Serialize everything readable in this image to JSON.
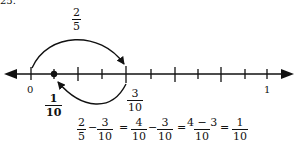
{
  "problem_number": "25.",
  "number_line": {
    "start_label": "0",
    "end_label": "1",
    "tick_count": 11,
    "marked_point": {
      "num": "1",
      "den": "10"
    },
    "jump_forward": {
      "num": "2",
      "den": "5"
    },
    "jump_back_landing": {
      "num": "3",
      "den": "10"
    }
  },
  "equation": {
    "t1": {
      "num": "2",
      "den": "5"
    },
    "op1": "−",
    "t2": {
      "num": "3",
      "den": "10"
    },
    "eq1": "=",
    "t3": {
      "num": "4",
      "den": "10"
    },
    "op2": "−",
    "t4": {
      "num": "3",
      "den": "10"
    },
    "eq2": "=",
    "t5": {
      "num": "4 − 3",
      "den": "10"
    },
    "eq3": "=",
    "t6": {
      "num": "1",
      "den": "10"
    }
  }
}
